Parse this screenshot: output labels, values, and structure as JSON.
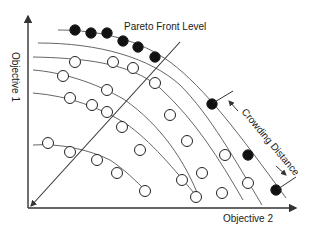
{
  "diagram": {
    "title_label": "Pareto Front Level",
    "annotation_label": "Crowding Distance",
    "y_axis_label": "Objective 1",
    "x_axis_label": "Objective 2",
    "colors": {
      "line": "#333333",
      "curve": "#555555",
      "filled_point": "#111111",
      "open_point_fill": "#ffffff",
      "background": "#ffffff"
    },
    "fronts": [
      {
        "name": "front-1",
        "filled": true,
        "curve": "M58,30 C100,30 140,40 170,62 C205,88 240,135 286,198",
        "points": [
          [
            75,
            30
          ],
          [
            91,
            33
          ],
          [
            107,
            33
          ],
          [
            123,
            41
          ],
          [
            138,
            47
          ],
          [
            155,
            57
          ],
          [
            212,
            104
          ],
          [
            248,
            155
          ],
          [
            276,
            190
          ]
        ]
      },
      {
        "name": "front-2",
        "filled": false,
        "curve": "M38,43 C100,43 150,58 180,85 C210,115 235,160 262,205",
        "points": []
      },
      {
        "name": "front-3",
        "filled": false,
        "curve": "M33,57 C80,58 130,62 160,88 C195,120 220,160 243,200",
        "points": [
          [
            75,
            62
          ],
          [
            113,
            62
          ],
          [
            133,
            68
          ],
          [
            155,
            83
          ],
          [
            170,
            115
          ],
          [
            225,
            155
          ],
          [
            248,
            183
          ]
        ]
      },
      {
        "name": "front-4",
        "filled": false,
        "curve": "M33,70 C60,72 95,82 125,100 C160,125 185,160 200,200",
        "points": [
          [
            63,
            76
          ],
          [
            107,
            90
          ],
          [
            187,
            141
          ],
          [
            202,
            173
          ],
          [
            222,
            193
          ]
        ]
      },
      {
        "name": "front-5",
        "filled": false,
        "curve": "M33,93 C70,96 100,108 125,123 C150,140 175,170 198,198",
        "points": [
          [
            70,
            98
          ],
          [
            92,
            105
          ],
          [
            107,
            112
          ],
          [
            122,
            127
          ],
          [
            140,
            150
          ],
          [
            182,
            180
          ],
          [
            196,
            197
          ]
        ]
      },
      {
        "name": "front-6",
        "filled": false,
        "curve": "M33,145 C60,143 90,150 110,160 C125,170 135,180 147,192",
        "points": [
          [
            48,
            143
          ],
          [
            70,
            152
          ],
          [
            97,
            160
          ],
          [
            117,
            173
          ],
          [
            145,
            191
          ]
        ]
      }
    ]
  }
}
